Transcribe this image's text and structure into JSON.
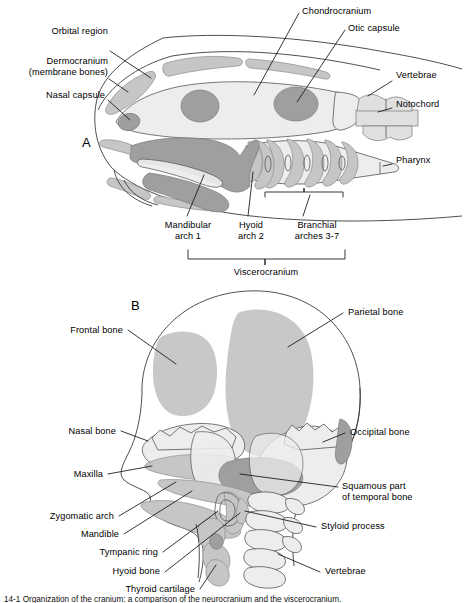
{
  "figure": {
    "caption_partial": "14-1  Organization of the cranium: a comparison of the neurocranium and the viscerocranium.",
    "panels": [
      {
        "id": "A",
        "letter": "A",
        "subject": "Generalized vertebrate (fish) skull in lateral view"
      },
      {
        "id": "B",
        "letter": "B",
        "subject": "Human fetal skull in frontal / oblique view"
      }
    ]
  },
  "colors": {
    "outline": "#3b3b3b",
    "light_gray": "#eaeaea",
    "mid_gray": "#c6c6c6",
    "dark_gray": "#9a9a9a",
    "bone_pale": "#e3e3e3",
    "leader_line": "#1a1a1a",
    "background": "#ffffff"
  },
  "panel_a": {
    "letter": "A",
    "labels": [
      {
        "id": "dermocranium",
        "text_line1": "Dermocranium",
        "text_line2": "(membrane bones)",
        "align": "right"
      },
      {
        "id": "orbital-region",
        "text": "Orbital region",
        "align": "right"
      },
      {
        "id": "nasal-capsule",
        "text": "Nasal capsule",
        "align": "right"
      },
      {
        "id": "chondrocranium",
        "text": "Chondrocranium",
        "align": "left"
      },
      {
        "id": "otic-capsule",
        "text": "Otic capsule",
        "align": "left"
      },
      {
        "id": "vertebrae",
        "text": "Vertebrae",
        "align": "left"
      },
      {
        "id": "notochord",
        "text": "Notochord",
        "align": "left"
      },
      {
        "id": "pharynx",
        "text": "Pharynx",
        "align": "left"
      }
    ],
    "bracket_labels": [
      {
        "id": "mandibular-arch",
        "line1": "Mandibular",
        "line2": "arch 1"
      },
      {
        "id": "hyoid-arch",
        "line1": "Hyoid",
        "line2": "arch 2"
      },
      {
        "id": "branchial-arches",
        "line1": "Branchial",
        "line2": "arches 3-7"
      }
    ],
    "group_bracket_label": "Viscerocranium",
    "branchial_arch_count": 6
  },
  "panel_b": {
    "letter": "B",
    "labels_left": [
      {
        "id": "frontal-bone",
        "text": "Frontal bone"
      },
      {
        "id": "nasal-bone",
        "text": "Nasal bone"
      },
      {
        "id": "maxilla",
        "text": "Maxilla"
      },
      {
        "id": "zygomatic-arch",
        "text": "Zygomatic arch"
      },
      {
        "id": "mandible",
        "text": "Mandible"
      },
      {
        "id": "tympanic-ring",
        "text": "Tympanic ring"
      },
      {
        "id": "hyoid-bone",
        "text": "Hyoid bone"
      },
      {
        "id": "thyroid-cartilage",
        "text": "Thyroid cartilage"
      }
    ],
    "labels_right": [
      {
        "id": "parietal-bone",
        "text": "Parietal bone"
      },
      {
        "id": "occipital-bone",
        "text": "Occipital bone"
      },
      {
        "id": "squamous-temporal",
        "line1": "Squamous part",
        "line2": "of temporal bone"
      },
      {
        "id": "styloid-process",
        "text": "Styloid process"
      },
      {
        "id": "vertebrae",
        "text": "Vertebrae"
      }
    ]
  }
}
